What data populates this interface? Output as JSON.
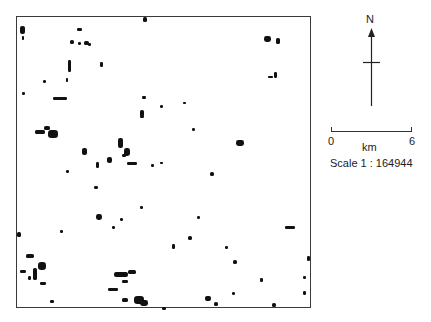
{
  "map": {
    "frame": {
      "x": 16,
      "y": 16,
      "width": 295,
      "height": 292,
      "border_color": "#3a3a3a"
    },
    "feature_color": "#111111",
    "features": [
      {
        "x": 20,
        "y": 26,
        "w": 5,
        "h": 8
      },
      {
        "x": 22,
        "y": 36,
        "w": 2,
        "h": 4
      },
      {
        "x": 77,
        "y": 28,
        "w": 5,
        "h": 3
      },
      {
        "x": 70,
        "y": 40,
        "w": 4,
        "h": 4
      },
      {
        "x": 78,
        "y": 42,
        "w": 3,
        "h": 3
      },
      {
        "x": 84,
        "y": 41,
        "w": 5,
        "h": 4
      },
      {
        "x": 88,
        "y": 43,
        "w": 3,
        "h": 3
      },
      {
        "x": 68,
        "y": 60,
        "w": 3,
        "h": 12
      },
      {
        "x": 66,
        "y": 78,
        "w": 2,
        "h": 4
      },
      {
        "x": 100,
        "y": 62,
        "w": 3,
        "h": 5
      },
      {
        "x": 43,
        "y": 80,
        "w": 3,
        "h": 3
      },
      {
        "x": 22,
        "y": 92,
        "w": 3,
        "h": 3
      },
      {
        "x": 53,
        "y": 97,
        "w": 14,
        "h": 3
      },
      {
        "x": 142,
        "y": 96,
        "w": 4,
        "h": 3
      },
      {
        "x": 140,
        "y": 110,
        "w": 4,
        "h": 6
      },
      {
        "x": 143,
        "y": 12,
        "w": 4,
        "h": 5
      },
      {
        "x": 264,
        "y": 36,
        "w": 7,
        "h": 6
      },
      {
        "x": 276,
        "y": 38,
        "w": 4,
        "h": 6
      },
      {
        "x": 274,
        "y": 72,
        "w": 3,
        "h": 6
      },
      {
        "x": 268,
        "y": 76,
        "w": 5,
        "h": 2
      },
      {
        "x": 35,
        "y": 130,
        "w": 10,
        "h": 4
      },
      {
        "x": 48,
        "y": 130,
        "w": 10,
        "h": 8
      },
      {
        "x": 44,
        "y": 126,
        "w": 6,
        "h": 4
      },
      {
        "x": 82,
        "y": 148,
        "w": 5,
        "h": 7
      },
      {
        "x": 107,
        "y": 157,
        "w": 5,
        "h": 6
      },
      {
        "x": 118,
        "y": 138,
        "w": 5,
        "h": 10
      },
      {
        "x": 124,
        "y": 148,
        "w": 6,
        "h": 8
      },
      {
        "x": 122,
        "y": 154,
        "w": 4,
        "h": 3
      },
      {
        "x": 127,
        "y": 162,
        "w": 10,
        "h": 3
      },
      {
        "x": 96,
        "y": 162,
        "w": 3,
        "h": 6
      },
      {
        "x": 151,
        "y": 164,
        "w": 3,
        "h": 3
      },
      {
        "x": 140,
        "y": 115,
        "w": 4,
        "h": 3
      },
      {
        "x": 160,
        "y": 105,
        "w": 3,
        "h": 3
      },
      {
        "x": 183,
        "y": 102,
        "w": 3,
        "h": 2
      },
      {
        "x": 236,
        "y": 140,
        "w": 8,
        "h": 6
      },
      {
        "x": 210,
        "y": 172,
        "w": 4,
        "h": 4
      },
      {
        "x": 94,
        "y": 186,
        "w": 4,
        "h": 3
      },
      {
        "x": 160,
        "y": 162,
        "w": 3,
        "h": 2
      },
      {
        "x": 192,
        "y": 128,
        "w": 3,
        "h": 3
      },
      {
        "x": 285,
        "y": 226,
        "w": 10,
        "h": 3
      },
      {
        "x": 233,
        "y": 260,
        "w": 4,
        "h": 4
      },
      {
        "x": 188,
        "y": 236,
        "w": 4,
        "h": 4
      },
      {
        "x": 96,
        "y": 214,
        "w": 6,
        "h": 6
      },
      {
        "x": 112,
        "y": 226,
        "w": 3,
        "h": 3
      },
      {
        "x": 172,
        "y": 244,
        "w": 3,
        "h": 5
      },
      {
        "x": 260,
        "y": 278,
        "w": 3,
        "h": 4
      },
      {
        "x": 120,
        "y": 218,
        "w": 3,
        "h": 3
      },
      {
        "x": 16,
        "y": 232,
        "w": 4,
        "h": 5
      },
      {
        "x": 26,
        "y": 254,
        "w": 8,
        "h": 4
      },
      {
        "x": 38,
        "y": 262,
        "w": 8,
        "h": 8
      },
      {
        "x": 20,
        "y": 270,
        "w": 6,
        "h": 3
      },
      {
        "x": 40,
        "y": 282,
        "w": 6,
        "h": 3
      },
      {
        "x": 50,
        "y": 300,
        "w": 4,
        "h": 3
      },
      {
        "x": 33,
        "y": 268,
        "w": 4,
        "h": 12
      },
      {
        "x": 28,
        "y": 276,
        "w": 3,
        "h": 4
      },
      {
        "x": 114,
        "y": 272,
        "w": 14,
        "h": 5
      },
      {
        "x": 128,
        "y": 270,
        "w": 8,
        "h": 4
      },
      {
        "x": 122,
        "y": 280,
        "w": 6,
        "h": 3
      },
      {
        "x": 108,
        "y": 288,
        "w": 10,
        "h": 3
      },
      {
        "x": 134,
        "y": 296,
        "w": 10,
        "h": 8
      },
      {
        "x": 140,
        "y": 300,
        "w": 8,
        "h": 6
      },
      {
        "x": 122,
        "y": 298,
        "w": 6,
        "h": 4
      },
      {
        "x": 162,
        "y": 307,
        "w": 4,
        "h": 3
      },
      {
        "x": 205,
        "y": 296,
        "w": 6,
        "h": 5
      },
      {
        "x": 214,
        "y": 302,
        "w": 4,
        "h": 4
      },
      {
        "x": 232,
        "y": 292,
        "w": 3,
        "h": 3
      },
      {
        "x": 272,
        "y": 303,
        "w": 4,
        "h": 4
      },
      {
        "x": 303,
        "y": 291,
        "w": 3,
        "h": 4
      },
      {
        "x": 307,
        "y": 256,
        "w": 3,
        "h": 5
      },
      {
        "x": 303,
        "y": 276,
        "w": 3,
        "h": 3
      },
      {
        "x": 197,
        "y": 216,
        "w": 3,
        "h": 3
      },
      {
        "x": 225,
        "y": 246,
        "w": 3,
        "h": 3
      },
      {
        "x": 66,
        "y": 170,
        "w": 3,
        "h": 3
      },
      {
        "x": 140,
        "y": 206,
        "w": 3,
        "h": 3
      },
      {
        "x": 60,
        "y": 230,
        "w": 3,
        "h": 3
      }
    ]
  },
  "north_arrow": {
    "label": "N"
  },
  "scale_bar": {
    "start_label": "0",
    "end_label": "6",
    "unit_label": "km",
    "ratio_label": "Scale 1 : 164944"
  }
}
